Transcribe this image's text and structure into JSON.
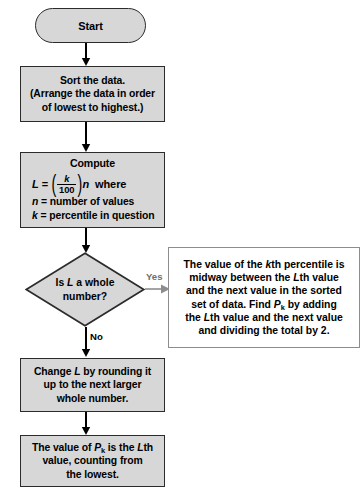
{
  "diagram": {
    "type": "flowchart",
    "colors": {
      "node_fill": "#d7d7d7",
      "node_border": "#2b2b2b",
      "note_fill": "#ffffff",
      "note_border": "#8d8d8d",
      "connector": "#000000",
      "yes_connector": "#8d8d8d",
      "background": "#ffffff"
    }
  },
  "nodes": {
    "start": {
      "label": "Start",
      "shape": "terminator"
    },
    "sort": {
      "line1": "Sort the data.",
      "line2": "(Arrange the data in order",
      "line3": "of lowest to highest.)",
      "shape": "process"
    },
    "compute": {
      "title": "Compute",
      "formula": {
        "lhs": "L",
        "equals": "=",
        "paren_open": "(",
        "numerator": "k",
        "denominator": "100",
        "paren_close": ")",
        "multiplier": "n",
        "suffix": "where"
      },
      "def_n_var": "n",
      "def_n_text": "= number of values",
      "def_k_var": "k",
      "def_k_text": "= percentile in question",
      "shape": "process"
    },
    "decision": {
      "prefix": "Is ",
      "variable": "L",
      "suffix": " a whole",
      "line2": "number?",
      "shape": "decision"
    },
    "yes_note": {
      "seg1": "The value of the ",
      "seg1_var": "k",
      "seg2": "th percentile is",
      "seg3": "midway between the ",
      "seg3_var": "L",
      "seg4": "th value",
      "seg5": "and the next value in the sorted",
      "seg6": "set of data. Find ",
      "seg6_var": "P",
      "seg6_sub": "k",
      "seg7": " by adding",
      "seg8": "the ",
      "seg8_var": "L",
      "seg9": "th value and the next value",
      "seg10": "and dividing the total by 2.",
      "shape": "note"
    },
    "round_up": {
      "seg1": "Change ",
      "seg1_var": "L",
      "seg2": " by rounding it",
      "line2": "up to the next larger",
      "line3": "whole number.",
      "shape": "process"
    },
    "result": {
      "seg1": "The value of ",
      "seg1_var": "P",
      "seg1_sub": "k",
      "seg2": " is the ",
      "seg2_var": "L",
      "seg3": "th",
      "line2": "value, counting from",
      "line3": "the lowest.",
      "shape": "process"
    }
  },
  "branches": {
    "yes_label": "Yes",
    "no_label": "No"
  }
}
